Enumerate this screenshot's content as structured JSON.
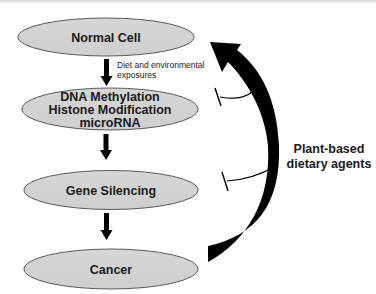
{
  "diagram": {
    "nodes": [
      {
        "id": "normal-cell",
        "lines": [
          "Normal Cell"
        ]
      },
      {
        "id": "epigenetic",
        "lines": [
          "DNA Methylation",
          "Histone Modification",
          "microRNA"
        ]
      },
      {
        "id": "gene-silencing",
        "lines": [
          "Gene Silencing"
        ]
      },
      {
        "id": "cancer",
        "lines": [
          "Cancer"
        ]
      }
    ],
    "edges": [
      {
        "from": "normal-cell",
        "to": "epigenetic",
        "label_lines": [
          "Diet and environmental",
          "exposures"
        ]
      },
      {
        "from": "epigenetic",
        "to": "gene-silencing"
      },
      {
        "from": "gene-silencing",
        "to": "cancer"
      },
      {
        "from": "cancer",
        "to": "normal-cell",
        "style": "large curved reversal arrow"
      }
    ],
    "inhibitor": {
      "label_lines": [
        "Plant-based",
        "dietary agents"
      ],
      "inhibits": [
        "epigenetic",
        "gene-silencing"
      ]
    },
    "colors": {
      "node_fill": "#d3d3d3",
      "node_stroke": "#5a5a5a",
      "arrow": "#000000",
      "text": "#1a1a1a"
    }
  }
}
